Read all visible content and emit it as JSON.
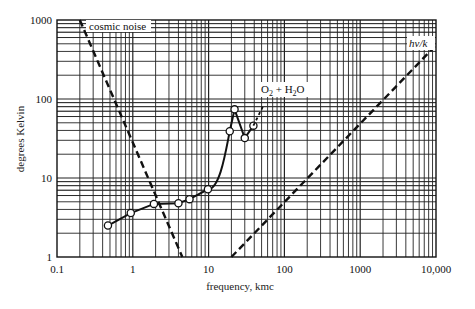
{
  "chart_data": {
    "type": "line",
    "title": "",
    "xlabel": "frequency, kmc",
    "ylabel": "degrees Kelvin",
    "xscale": "log",
    "yscale": "log",
    "xlim": [
      0.1,
      10000
    ],
    "ylim": [
      1,
      1000
    ],
    "grid": true,
    "x_ticks": [
      {
        "value": 0.1,
        "label": "0.1"
      },
      {
        "value": 1,
        "label": "1"
      },
      {
        "value": 10,
        "label": "10"
      },
      {
        "value": 100,
        "label": "100"
      },
      {
        "value": 1000,
        "label": "1000"
      },
      {
        "value": 10000,
        "label": "10,000"
      }
    ],
    "y_ticks": [
      {
        "value": 1,
        "label": "1"
      },
      {
        "value": 10,
        "label": "10"
      },
      {
        "value": 100,
        "label": "100"
      },
      {
        "value": 1000,
        "label": "1000"
      }
    ],
    "series": [
      {
        "name": "cosmic noise",
        "style": "dashed",
        "x": [
          0.2,
          4.5
        ],
        "y": [
          1000,
          1
        ],
        "label_at": {
          "x": 0.3,
          "y": 900
        }
      },
      {
        "name": "measured temperature",
        "style": "solid-with-open-markers",
        "x": [
          0.47,
          0.94,
          1.9,
          4.0,
          5.6,
          9.8,
          19,
          22,
          30,
          39
        ],
        "y": [
          2.5,
          3.6,
          4.7,
          4.8,
          5.4,
          7.2,
          39,
          74,
          32,
          46
        ]
      },
      {
        "name": "O2 + H2O",
        "style": "dotted-extension",
        "x": [
          39,
          52
        ],
        "y": [
          46,
          80
        ],
        "label_at": {
          "x": 60,
          "y": 95
        }
      },
      {
        "name": "hν/k",
        "style": "dashed",
        "x": [
          20,
          10000
        ],
        "y": [
          1,
          480
        ],
        "label_at": {
          "x": 4000,
          "y": 620
        }
      }
    ],
    "annotations": [
      {
        "text": "cosmic noise"
      },
      {
        "text": "O2 + H2O"
      },
      {
        "text": "hν/k"
      }
    ]
  },
  "labels": {
    "xlabel": "frequency, kmc",
    "ylabel": "degrees Kelvin",
    "cosmic": "cosmic noise",
    "o2_main": "O",
    "o2_sub": "2",
    "h2o_plus": " + H",
    "h2o_sub": "2",
    "h2o_end": "O",
    "hvk": "hν/k"
  }
}
